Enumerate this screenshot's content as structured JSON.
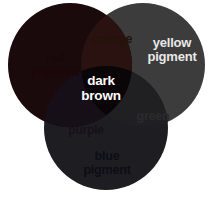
{
  "diagram": {
    "background_color": "#ffffff",
    "circles": [
      {
        "id": "red-pigment",
        "label": "red\npigment",
        "color": "#1a0a0c",
        "cx": 70,
        "cy": 65,
        "r": 62
      },
      {
        "id": "yellow-pigment",
        "label": "yellow\npigment",
        "color": "#3c3c3c",
        "cx": 143,
        "cy": 65,
        "r": 62
      },
      {
        "id": "blue-pigment",
        "label": "blue\npigment",
        "color": "#1e1e22",
        "cx": 106,
        "cy": 128,
        "r": 62
      }
    ],
    "overlaps": [
      {
        "id": "orange",
        "label": "orange",
        "color": "#291210",
        "parents": [
          "red-pigment",
          "yellow-pigment"
        ]
      },
      {
        "id": "green",
        "label": "green",
        "color": "#202022",
        "parents": [
          "yellow-pigment",
          "blue-pigment"
        ]
      },
      {
        "id": "purple",
        "label": "purple",
        "color": "#170f18",
        "parents": [
          "red-pigment",
          "blue-pigment"
        ]
      },
      {
        "id": "dark-brown",
        "label": "dark\nbrown",
        "color": "#0a0507",
        "parents": [
          "red-pigment",
          "yellow-pigment",
          "blue-pigment"
        ]
      }
    ],
    "label_colors": {
      "on_light": "#1a1a1a",
      "on_dark": "#f2f2f2"
    }
  }
}
